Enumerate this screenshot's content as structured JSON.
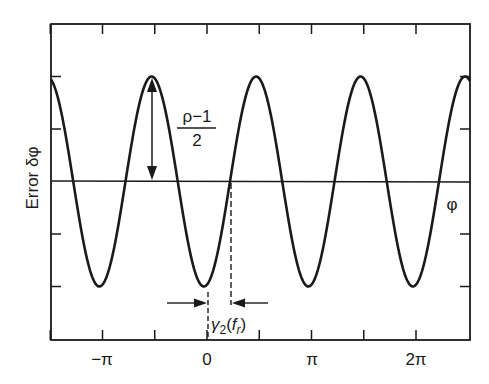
{
  "chart_data": {
    "type": "line",
    "title": "",
    "xlabel": "φ",
    "ylabel": "Error δφ",
    "x_tick_labels": [
      "−π",
      "0",
      "π",
      "2π"
    ],
    "x_tick_values_pi": [
      -1,
      0,
      1,
      2
    ],
    "x_minor_ticks_pi": [
      -1.5,
      -1,
      -0.5,
      0,
      0.5,
      1,
      1.5,
      2
    ],
    "xlim_pi": [
      -1.5,
      2.52
    ],
    "y_ticks_normalized": [
      1,
      0.5,
      0,
      -0.5,
      -1
    ],
    "ylim_normalized": [
      -1.52,
      1.01
    ],
    "grid": false,
    "legend": null,
    "series": [
      {
        "name": "Error δφ vs φ",
        "function": "-A*cos(2*(φ - φ0))",
        "amplitude_label": "(ρ−1)/2",
        "amplitude_normalized": 1,
        "period_pi": 1,
        "phase_offset_pi": -0.03,
        "troughs_pi": [
          -1.03,
          -0.03,
          0.97,
          1.97
        ],
        "peaks_pi": [
          -0.53,
          0.47,
          1.47,
          2.47
        ]
      }
    ],
    "annotations": [
      {
        "type": "double-arrow",
        "label": "(ρ−1)/2",
        "numerator": "ρ−1",
        "denominator": "2",
        "from": "peak at φ≈−π/2",
        "to": "zero line"
      },
      {
        "type": "interval",
        "label": "γ2(fr)",
        "from_pi": -0.03,
        "to_pi": 0.22,
        "description": "shift between trough and zero crossing"
      }
    ]
  },
  "labels": {
    "y_axis": "Error δφ",
    "x_axis_symbol": "φ",
    "amplitude_numerator": "ρ−1",
    "amplitude_denominator": "2",
    "gamma_main": "γ",
    "gamma_sub": "2",
    "gamma_open": "(",
    "gamma_f": "f",
    "gamma_fsub": "r",
    "gamma_close": ")",
    "ticks": [
      "−π",
      "0",
      "π",
      "2π"
    ]
  },
  "colors": {
    "ink": "#1a1a1a",
    "background": "#ffffff"
  }
}
